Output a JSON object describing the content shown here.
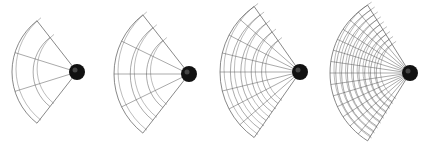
{
  "figure": {
    "background_color": "#ffffff",
    "line_color": "#555555",
    "sphere_color": "#111111",
    "panels": [
      {
        "id": 1,
        "hub": [
          77,
          72
        ],
        "radius": 65,
        "spokes": 2,
        "arcs": 2,
        "angle_start": 128,
        "angle_end": 232
      },
      {
        "id": 2,
        "hub": [
          84,
          74
        ],
        "radius": 75,
        "spokes": 3,
        "arcs": 3,
        "angle_start": 128,
        "angle_end": 232
      },
      {
        "id": 3,
        "hub": [
          88,
          72
        ],
        "radius": 80,
        "spokes": 7,
        "arcs": 5,
        "angle_start": 125,
        "angle_end": 235
      },
      {
        "id": 4,
        "hub": [
          88,
          73
        ],
        "radius": 80,
        "spokes": 13,
        "arcs": 9,
        "angle_start": 122,
        "angle_end": 238
      }
    ]
  }
}
